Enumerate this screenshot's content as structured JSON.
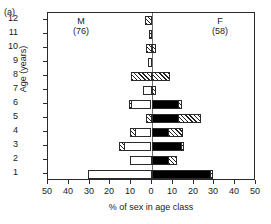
{
  "panel": {
    "label": "(a)"
  },
  "axes": {
    "y_title": "Age (years)",
    "x_title": "% of sex in age class",
    "y_ticks": [
      "12",
      "11",
      "10",
      "9",
      "8",
      "7",
      "6",
      "5",
      "4",
      "3",
      "2",
      "1"
    ],
    "x_ticks": [
      "50",
      "40",
      "30",
      "20",
      "10",
      "0",
      "10",
      "20",
      "30",
      "40",
      "50"
    ]
  },
  "legend": {
    "male_label": "M",
    "male_n": "(76)",
    "female_label": "F",
    "female_n": "(58)"
  },
  "colors": {
    "axis": "#2b2b2b",
    "zero_line": "#6e6e6e",
    "solid_fill": "#000000",
    "open_fill": "#ffffff",
    "hatch_stroke": "#222222"
  },
  "chart_data": {
    "type": "bar",
    "orientation": "horizontal",
    "style": "population-pyramid",
    "title": "",
    "xlabel": "% of sex in age class",
    "ylabel": "Age (years)",
    "xlim": [
      -55,
      55
    ],
    "x_tick_values": [
      -50,
      -40,
      -30,
      -20,
      -10,
      0,
      10,
      20,
      30,
      40,
      50
    ],
    "x_tick_labels": [
      "50",
      "40",
      "30",
      "20",
      "10",
      "0",
      "10",
      "20",
      "30",
      "40",
      "50"
    ],
    "categories": [
      "1",
      "2",
      "3",
      "4",
      "5",
      "6",
      "7",
      "8",
      "9",
      "10",
      "11",
      "12"
    ],
    "grid": false,
    "legend_position": "inside-top-corners",
    "series": [
      {
        "name": "M",
        "n": 76,
        "side": "left",
        "values": [
          31.0,
          10.5,
          16.0,
          10.5,
          3.0,
          11.0,
          4.5,
          10.0,
          2.0,
          3.0,
          1.5,
          3.5
        ],
        "segments": [
          {
            "age": "1",
            "total": 31.0,
            "parts": [
              {
                "fill": "open",
                "value": 31.0
              }
            ]
          },
          {
            "age": "2",
            "total": 10.5,
            "parts": [
              {
                "fill": "open",
                "value": 10.5
              }
            ]
          },
          {
            "age": "3",
            "total": 16.0,
            "parts": [
              {
                "fill": "hatch",
                "value": 3.0
              },
              {
                "fill": "open",
                "value": 13.0
              }
            ]
          },
          {
            "age": "4",
            "total": 10.5,
            "parts": [
              {
                "fill": "hatch",
                "value": 3.0
              },
              {
                "fill": "open",
                "value": 7.5
              }
            ]
          },
          {
            "age": "5",
            "total": 3.0,
            "parts": [
              {
                "fill": "hatch",
                "value": 3.0
              }
            ]
          },
          {
            "age": "6",
            "total": 11.0,
            "parts": [
              {
                "fill": "hatch",
                "value": 1.5
              },
              {
                "fill": "open",
                "value": 9.5
              }
            ]
          },
          {
            "age": "7",
            "total": 4.5,
            "parts": [
              {
                "fill": "open",
                "value": 4.5
              }
            ]
          },
          {
            "age": "8",
            "total": 10.0,
            "parts": [
              {
                "fill": "hatch",
                "value": 10.0
              }
            ]
          },
          {
            "age": "9",
            "total": 2.0,
            "parts": [
              {
                "fill": "open",
                "value": 2.0
              }
            ]
          },
          {
            "age": "10",
            "total": 3.0,
            "parts": [
              {
                "fill": "hatch",
                "value": 3.0
              }
            ]
          },
          {
            "age": "11",
            "total": 1.5,
            "parts": [
              {
                "fill": "hatch",
                "value": 1.5
              }
            ]
          },
          {
            "age": "12",
            "total": 3.5,
            "parts": [
              {
                "fill": "hatch",
                "value": 3.5
              }
            ]
          }
        ]
      },
      {
        "name": "F",
        "n": 58,
        "side": "right",
        "values": [
          30.0,
          12.5,
          16.0,
          15.5,
          24.0,
          15.0,
          2.0,
          8.5,
          0.0,
          2.0,
          0.0,
          0.0
        ],
        "segments": [
          {
            "age": "1",
            "total": 30.0,
            "parts": [
              {
                "fill": "solid",
                "value": 28.5
              },
              {
                "fill": "hatch",
                "value": 1.5
              }
            ]
          },
          {
            "age": "2",
            "total": 12.5,
            "parts": [
              {
                "fill": "solid",
                "value": 8.0
              },
              {
                "fill": "hatch",
                "value": 4.5
              }
            ]
          },
          {
            "age": "3",
            "total": 16.0,
            "parts": [
              {
                "fill": "solid",
                "value": 14.5
              },
              {
                "fill": "hatch",
                "value": 1.5
              }
            ]
          },
          {
            "age": "4",
            "total": 15.5,
            "parts": [
              {
                "fill": "solid",
                "value": 8.0
              },
              {
                "fill": "hatch",
                "value": 7.5
              }
            ]
          },
          {
            "age": "5",
            "total": 24.0,
            "parts": [
              {
                "fill": "solid",
                "value": 13.0
              },
              {
                "fill": "hatch",
                "value": 11.0
              }
            ]
          },
          {
            "age": "6",
            "total": 15.0,
            "parts": [
              {
                "fill": "solid",
                "value": 13.0
              },
              {
                "fill": "hatch",
                "value": 2.0
              }
            ]
          },
          {
            "age": "7",
            "total": 2.0,
            "parts": [
              {
                "fill": "hatch",
                "value": 2.0
              }
            ]
          },
          {
            "age": "8",
            "total": 8.5,
            "parts": [
              {
                "fill": "hatch",
                "value": 8.5
              }
            ]
          },
          {
            "age": "9",
            "total": 0.0,
            "parts": []
          },
          {
            "age": "10",
            "total": 2.0,
            "parts": [
              {
                "fill": "hatch",
                "value": 2.0
              }
            ]
          },
          {
            "age": "11",
            "total": 0.0,
            "parts": []
          },
          {
            "age": "12",
            "total": 0.0,
            "parts": []
          }
        ]
      }
    ]
  }
}
